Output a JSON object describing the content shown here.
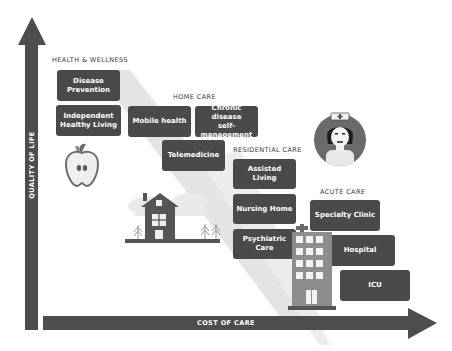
{
  "axes": {
    "y_label": "QUALITY OF LIFE",
    "x_label": "COST OF CARE"
  },
  "categories": {
    "health_wellness": {
      "title": "HEALTH & WELLNESS",
      "items": [
        "Disease\nPrevention",
        "Independent\nHealthy Living"
      ]
    },
    "home_care": {
      "title": "HOME CARE",
      "items": [
        "Mobile health",
        "Chronic disease\nself-management",
        "Telemedicine"
      ]
    },
    "residential_care": {
      "title": "RESIDENTIAL CARE",
      "items": [
        "Assisted Living",
        "Nursing Home",
        "Psychiatric Care"
      ]
    },
    "acute_care": {
      "title": "ACUTE CARE",
      "items": [
        "Specialty Clinic",
        "Hospital",
        "ICU"
      ]
    }
  },
  "illustrations": [
    "apple-icon",
    "house-icon",
    "nurse-avatar-icon",
    "hospital-building-icon"
  ],
  "colors": {
    "box": "#4a4a4a",
    "axis": "#4d4d4d",
    "band": "#e2e2e2",
    "text_light": "#ffffff"
  }
}
